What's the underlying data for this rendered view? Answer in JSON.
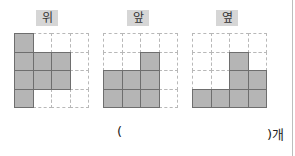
{
  "views": [
    {
      "label": "위",
      "grid": [
        [
          1,
          0,
          0,
          0
        ],
        [
          1,
          1,
          1,
          0
        ],
        [
          1,
          1,
          1,
          0
        ],
        [
          1,
          0,
          0,
          0
        ]
      ]
    },
    {
      "label": "앞",
      "grid": [
        [
          0,
          0,
          0,
          0
        ],
        [
          0,
          0,
          1,
          0
        ],
        [
          1,
          1,
          1,
          0
        ],
        [
          1,
          1,
          1,
          0
        ]
      ]
    },
    {
      "label": "옆",
      "grid": [
        [
          0,
          0,
          0,
          0
        ],
        [
          0,
          0,
          1,
          0
        ],
        [
          0,
          0,
          1,
          1
        ],
        [
          1,
          1,
          1,
          1
        ]
      ]
    }
  ],
  "answer": {
    "open_paren": "(",
    "close_suffix": ")개",
    "value": ""
  },
  "colors": {
    "filled_cell": "#b5b5b5",
    "label_bg": "#d6d6d6"
  }
}
